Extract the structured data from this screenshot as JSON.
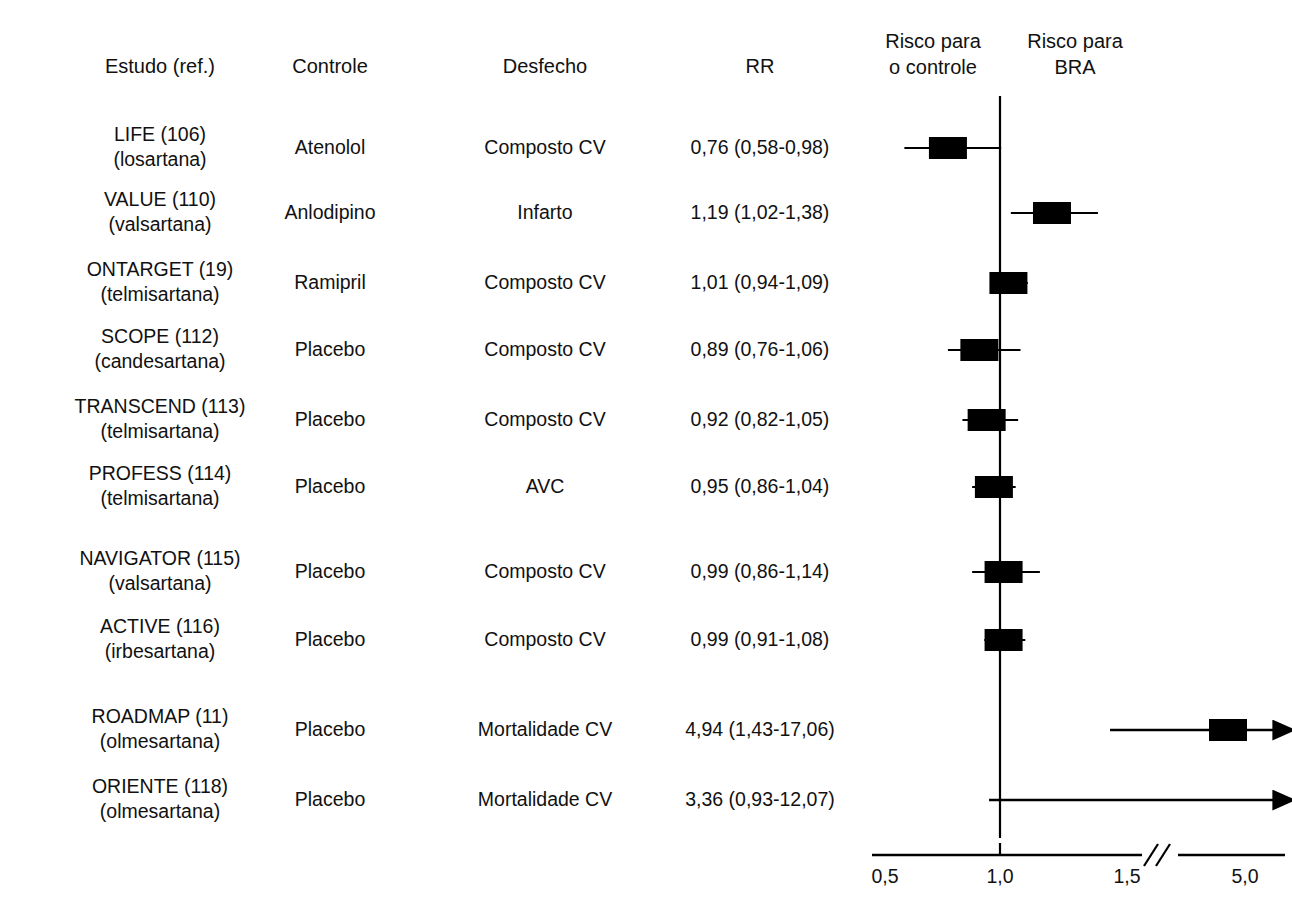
{
  "figure": {
    "type": "forest-plot",
    "headers": {
      "study": "Estudo (ref.)",
      "control": "Controle",
      "outcome": "Desfecho",
      "rr": "RR",
      "risk_left_line1": "Risco para",
      "risk_left_line2": "o controle",
      "risk_right_line1": "Risco para",
      "risk_right_line2": "BRA"
    },
    "axis": {
      "tick_labels": [
        "0,5",
        "1,0",
        "1,5",
        "5,0"
      ],
      "null_value": "1,0",
      "has_break": true,
      "break_symbol": "//"
    },
    "colors": {
      "marker": "#000000",
      "line": "#000000",
      "text": "#111111",
      "background": "#ffffff"
    }
  },
  "chart_data": {
    "type": "forest",
    "title": "",
    "xlabel": "",
    "ylabel": "",
    "xticks": [
      0.5,
      1.0,
      1.5,
      5.0
    ],
    "xtick_labels": [
      "0,5",
      "1,0",
      "1,5",
      "5,0"
    ],
    "null_line": 1.0,
    "axis_break_between": [
      1.5,
      5.0
    ],
    "legend_left": "Risco para o controle",
    "legend_right": "Risco para BRA",
    "columns": [
      "Estudo (ref.)",
      "Controle",
      "Desfecho",
      "RR"
    ],
    "rows": [
      {
        "study_line1": "LIFE (106)",
        "study_line2": "(losartana)",
        "control": "Atenolol",
        "outcome": "Composto CV",
        "rr_text": "0,76 (0,58-0,98)",
        "rr": 0.76,
        "ci_low": 0.58,
        "ci_high": 0.98,
        "arrow_right": false
      },
      {
        "study_line1": "VALUE (110)",
        "study_line2": "(valsartana)",
        "control": "Anlodipino",
        "outcome": "Infarto",
        "rr_text": "1,19 (1,02-1,38)",
        "rr": 1.19,
        "ci_low": 1.02,
        "ci_high": 1.38,
        "arrow_right": false
      },
      {
        "study_line1": "ONTARGET (19)",
        "study_line2": "(telmisartana)",
        "control": "Ramipril",
        "outcome": "Composto CV",
        "rr_text": "1,01 (0,94-1,09)",
        "rr": 1.01,
        "ci_low": 0.94,
        "ci_high": 1.09,
        "arrow_right": false
      },
      {
        "study_line1": "SCOPE (112)",
        "study_line2": "(candesartana)",
        "control": "Placebo",
        "outcome": "Composto CV",
        "rr_text": "0,89 (0,76-1,06)",
        "rr": 0.89,
        "ci_low": 0.76,
        "ci_high": 1.06,
        "arrow_right": false
      },
      {
        "study_line1": "TRANSCEND (113)",
        "study_line2": "(telmisartana)",
        "control": "Placebo",
        "outcome": "Composto CV",
        "rr_text": "0,92 (0,82-1,05)",
        "rr": 0.92,
        "ci_low": 0.82,
        "ci_high": 1.05,
        "arrow_right": false
      },
      {
        "study_line1": "PROFESS (114)",
        "study_line2": "(telmisartana)",
        "control": "Placebo",
        "outcome": "AVC",
        "rr_text": "0,95 (0,86-1,04)",
        "rr": 0.95,
        "ci_low": 0.86,
        "ci_high": 1.04,
        "arrow_right": false
      },
      {
        "study_line1": "NAVIGATOR (115)",
        "study_line2": "(valsartana)",
        "control": "Placebo",
        "outcome": "Composto CV",
        "rr_text": "0,99 (0,86-1,14)",
        "rr": 0.99,
        "ci_low": 0.86,
        "ci_high": 1.14,
        "arrow_right": false
      },
      {
        "study_line1": "ACTIVE (116)",
        "study_line2": "(irbesartana)",
        "control": "Placebo",
        "outcome": "Composto CV",
        "rr_text": "0,99 (0,91-1,08)",
        "rr": 0.99,
        "ci_low": 0.91,
        "ci_high": 1.08,
        "arrow_right": false
      },
      {
        "study_line1": "ROADMAP (11)",
        "study_line2": "(olmesartana)",
        "control": "Placebo",
        "outcome": "Mortalidade CV",
        "rr_text": "4,94 (1,43-17,06)",
        "rr": 4.94,
        "ci_low": 1.43,
        "ci_high": 17.06,
        "arrow_right": true
      },
      {
        "study_line1": "ORIENTE (118)",
        "study_line2": "(olmesartana)",
        "control": "Placebo",
        "outcome": "Mortalidade CV",
        "rr_text": "3,36 (0,93-12,07)",
        "rr": 3.36,
        "ci_low": 0.93,
        "ci_high": 12.07,
        "arrow_right": true
      }
    ]
  },
  "layout": {
    "x_study": 160,
    "x_control": 330,
    "x_outcome": 545,
    "x_rr": 760,
    "row_y": [
      148,
      213,
      283,
      350,
      420,
      487,
      572,
      640,
      730,
      800
    ],
    "axis_y": 855,
    "null_x": 1000,
    "plot_top": 96,
    "plot_bottom": 838
  }
}
